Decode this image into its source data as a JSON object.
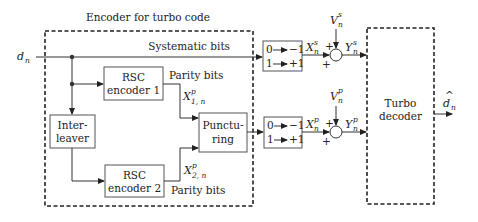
{
  "title": "Encoder for turbo code",
  "input": {
    "symbol": "d",
    "subscript": "n"
  },
  "main_line_label": "Systematic bits",
  "blocks": {
    "rsc1": {
      "line1": "RSC",
      "line2": "encoder 1"
    },
    "rsc2": {
      "line1": "RSC",
      "line2": "encoder 2"
    },
    "interleaver": {
      "line1": "Inter-",
      "line2": "leaver"
    },
    "puncturing": {
      "line1": "Punctu-",
      "line2": "ring"
    },
    "decoder": {
      "line1": "Turbo",
      "line2": "decoder"
    }
  },
  "parity_labels": {
    "top": "Parity bits",
    "bottom": "Parity bits"
  },
  "signals": {
    "x1p": {
      "symbol": "X",
      "sup": "p",
      "sub": "1, n"
    },
    "x2p": {
      "symbol": "X",
      "sup": "p",
      "sub": "2, n"
    },
    "xs": {
      "symbol": "X",
      "sup": "s",
      "sub": "n"
    },
    "xp": {
      "symbol": "X",
      "sup": "p",
      "sub": "n"
    },
    "vs": {
      "symbol": "V",
      "sup": "s",
      "sub": "n"
    },
    "vp": {
      "symbol": "V",
      "sup": "p",
      "sub": "n"
    },
    "ys": {
      "symbol": "Y",
      "sup": "s",
      "sub": "n"
    },
    "yp": {
      "symbol": "Y",
      "sup": "p",
      "sub": "n"
    }
  },
  "mappers": [
    {
      "row1_in": "0",
      "row1_out": "−1",
      "row2_in": "1",
      "row2_out": "+1"
    },
    {
      "row1_in": "0",
      "row1_out": "−1",
      "row2_in": "1",
      "row2_out": "+1"
    }
  ],
  "adder_signs": {
    "top": "+",
    "left": "+"
  },
  "output": {
    "symbol": "d",
    "hat": "^",
    "subscript": "n"
  }
}
